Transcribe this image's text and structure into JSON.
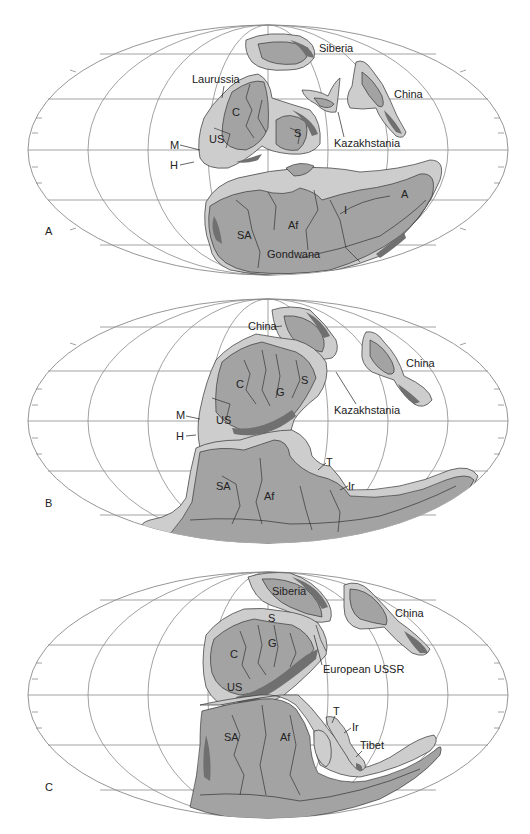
{
  "figure": {
    "projection": "Mollweide (equal-area elliptical)",
    "grid": {
      "meridian_spacing_deg": 30,
      "parallel_spacing_deg": 30
    },
    "colors": {
      "ocean": "#ffffff",
      "grid": "#8a8a8a",
      "land_light": "#cdcdcd",
      "land_mid": "#a3a3a3",
      "land_dark": "#707070",
      "outline": "#222222"
    }
  },
  "panels": [
    {
      "letter": "A",
      "labels": {
        "siberia": "Siberia",
        "china": "China",
        "laurussia": "Laurussia",
        "kazakhstania": "Kazakhstania",
        "c": "C",
        "us": "US",
        "s": "S",
        "m": "M",
        "h": "H",
        "sa": "SA",
        "af": "Af",
        "i": "I",
        "a": "A",
        "gondwana": "Gondwana"
      }
    },
    {
      "letter": "B",
      "labels": {
        "china_north": "China",
        "china_east": "China",
        "kazakhstania": "Kazakhstania",
        "c": "C",
        "g": "G",
        "s": "S",
        "us": "US",
        "m": "M",
        "h": "H",
        "sa": "SA",
        "af": "Af",
        "t": "T",
        "ir": "Ir"
      }
    },
    {
      "letter": "C",
      "labels": {
        "siberia": "Siberia",
        "china": "China",
        "s": "S",
        "g": "G",
        "c": "C",
        "us": "US",
        "european_ussr": "European USSR",
        "sa": "SA",
        "af": "Af",
        "t": "T",
        "ir": "Ir",
        "tibet": "Tibet"
      }
    }
  ]
}
